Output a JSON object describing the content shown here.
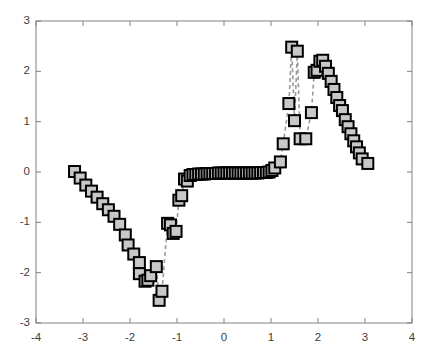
{
  "figure": {
    "background_color": "#ffffff",
    "axes_box_color": "#808080",
    "tick_label_color": "#3c3c3c"
  },
  "chart_data": {
    "type": "scatter",
    "title": "",
    "xlabel": "",
    "ylabel": "",
    "xlim": [
      -4,
      4
    ],
    "ylim": [
      -3,
      3
    ],
    "xticks": [
      -4,
      -3,
      -2,
      -1,
      0,
      1,
      2,
      3,
      4
    ],
    "yticks": [
      -3,
      -2,
      -1,
      0,
      1,
      2,
      3
    ],
    "xticklabels": [
      "-4",
      "-3",
      "-2",
      "-1",
      "0",
      "1",
      "2",
      "3",
      "4"
    ],
    "yticklabels": [
      "-3",
      "-2",
      "-1",
      "0",
      "1",
      "2",
      "3"
    ],
    "grid": false,
    "legend": null,
    "marker": {
      "shape": "square",
      "face_color": "#c8c8c8",
      "edge_color": "#000000",
      "size_px": 11,
      "edge_width_px": 2
    },
    "line": {
      "style": "dashed",
      "color": "#9a9a9a",
      "width_px": 1.6
    },
    "series": [
      {
        "name": "signal",
        "x": [
          -3.18,
          -3.06,
          -2.94,
          -2.82,
          -2.7,
          -2.58,
          -2.46,
          -2.34,
          -2.22,
          -2.1,
          -2.04,
          -1.92,
          -1.8,
          -1.8,
          -1.68,
          -1.62,
          -1.56,
          -1.44,
          -1.38,
          -1.32,
          -1.2,
          -1.14,
          -1.08,
          -1.02,
          -0.96,
          -0.9,
          -0.84,
          -0.78,
          -0.72,
          -0.66,
          -0.6,
          -0.54,
          -0.48,
          -0.42,
          -0.36,
          -0.3,
          -0.24,
          -0.18,
          -0.12,
          -0.06,
          0.0,
          0.06,
          0.12,
          0.18,
          0.24,
          0.3,
          0.36,
          0.42,
          0.48,
          0.54,
          0.6,
          0.66,
          0.72,
          0.78,
          0.84,
          0.9,
          0.96,
          1.02,
          1.08,
          1.2,
          1.26,
          1.38,
          1.44,
          1.5,
          1.56,
          1.62,
          1.74,
          1.86,
          1.92,
          1.98,
          2.04,
          2.1,
          2.16,
          2.22,
          2.28,
          2.34,
          2.4,
          2.46,
          2.52,
          2.58,
          2.64,
          2.7,
          2.76,
          2.82,
          2.88,
          2.94,
          3.06
        ],
        "y": [
          0.01,
          -0.12,
          -0.26,
          -0.38,
          -0.5,
          -0.63,
          -0.75,
          -0.88,
          -1.04,
          -1.25,
          -1.45,
          -1.63,
          -1.8,
          -2.02,
          -2.17,
          -2.15,
          -2.06,
          -1.88,
          -2.55,
          -2.37,
          -1.02,
          -1.05,
          -1.22,
          -1.18,
          -0.56,
          -0.47,
          -0.14,
          -0.18,
          -0.07,
          -0.05,
          -0.05,
          -0.04,
          -0.04,
          -0.04,
          -0.03,
          -0.03,
          -0.03,
          -0.03,
          -0.02,
          -0.02,
          -0.02,
          -0.02,
          -0.02,
          -0.02,
          -0.02,
          -0.02,
          -0.02,
          -0.02,
          -0.02,
          -0.02,
          -0.02,
          -0.02,
          -0.02,
          -0.01,
          -0.01,
          -0.01,
          0.0,
          0.03,
          0.08,
          0.2,
          0.56,
          1.36,
          2.48,
          1.02,
          2.4,
          0.66,
          0.66,
          1.18,
          1.98,
          2.02,
          2.2,
          2.22,
          2.1,
          1.96,
          1.8,
          1.64,
          1.48,
          1.32,
          1.22,
          1.04,
          0.9,
          0.76,
          0.62,
          0.5,
          0.38,
          0.26,
          0.17
        ],
        "connect_order": [
          0,
          1,
          2,
          3,
          4,
          5,
          6,
          7,
          8,
          9,
          10,
          11,
          12,
          13,
          14,
          15,
          16,
          17,
          18,
          19,
          20,
          21,
          22,
          23,
          24,
          25,
          26,
          27,
          28,
          29,
          30,
          31,
          32,
          33,
          34,
          35,
          36,
          37,
          38,
          39,
          40,
          41,
          42,
          43,
          44,
          45,
          46,
          47,
          48,
          49,
          50,
          51,
          52,
          53,
          54,
          55,
          56,
          57,
          58,
          59,
          60,
          61,
          62,
          63,
          64,
          65,
          66,
          67,
          68,
          69,
          70,
          71,
          72,
          73,
          74,
          75,
          76,
          77,
          78,
          79,
          80,
          81,
          82,
          83,
          84,
          85,
          86
        ]
      }
    ]
  }
}
